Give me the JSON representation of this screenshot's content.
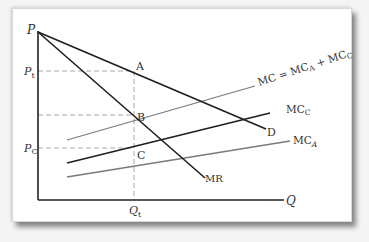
{
  "diagram": {
    "type": "price-discrimination / joint-cost economics diagram",
    "axes": {
      "y_label": "P",
      "x_label": "Q"
    },
    "price_labels": {
      "pt_main": "P",
      "pt_sub": "t",
      "pc_main": "P",
      "pc_sub": "C"
    },
    "quantity_label": {
      "main": "Q",
      "sub": "t"
    },
    "points": {
      "a": "A",
      "b": "B",
      "c": "C"
    },
    "curves": {
      "demand": "D",
      "mr": "MR",
      "mc_total": {
        "main": "MC = MC",
        "sub1": "A",
        "mid": " + MC",
        "sub2": "C"
      },
      "mc_c": {
        "main": "MC",
        "sub": "C"
      },
      "mc_a": {
        "main": "MC",
        "sub": "A"
      }
    },
    "colors": {
      "axis": "#222222",
      "dark_line": "#1e1e1e",
      "gray_line": "#7a7a7a",
      "dashed": "#a0a0a0"
    }
  }
}
